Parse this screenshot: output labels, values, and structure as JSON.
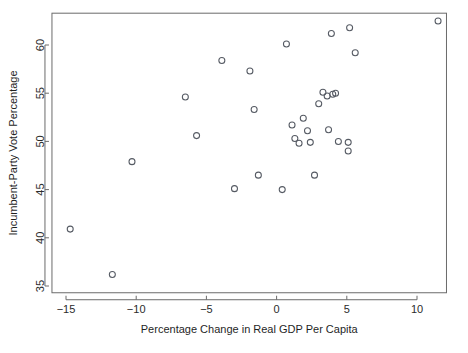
{
  "chart_data": {
    "type": "scatter",
    "title": "",
    "xlabel": "Percentage Change in Real GDP Per Capita",
    "ylabel": "Incumbent-Party Vote Percentage",
    "xlim": [
      -16.0,
      12.1
    ],
    "ylim": [
      34.3,
      63.3
    ],
    "grid": false,
    "legend": null,
    "marker": "open-circle",
    "marker_color": "#555a63",
    "frame_color": "#6b6b6b",
    "xticks": [
      -15,
      -10,
      -5,
      0,
      5,
      10
    ],
    "xtick_labels": [
      "−15",
      "−10",
      "−5",
      "0",
      "5",
      "10"
    ],
    "yticks": [
      35,
      40,
      45,
      50,
      55,
      60
    ],
    "ytick_labels": [
      "35",
      "40",
      "45",
      "50",
      "55",
      "60"
    ],
    "series": [
      {
        "name": "elections",
        "points": [
          {
            "x": -14.7,
            "y": 40.9
          },
          {
            "x": -11.7,
            "y": 36.2
          },
          {
            "x": -10.3,
            "y": 47.9
          },
          {
            "x": -6.5,
            "y": 54.6
          },
          {
            "x": -5.7,
            "y": 50.6
          },
          {
            "x": -3.9,
            "y": 58.4
          },
          {
            "x": -3.0,
            "y": 45.1
          },
          {
            "x": -1.9,
            "y": 57.3
          },
          {
            "x": -1.6,
            "y": 53.3
          },
          {
            "x": -1.3,
            "y": 46.5
          },
          {
            "x": 0.4,
            "y": 45.0
          },
          {
            "x": 0.7,
            "y": 60.1
          },
          {
            "x": 1.1,
            "y": 51.7
          },
          {
            "x": 1.3,
            "y": 50.3
          },
          {
            "x": 1.6,
            "y": 49.8
          },
          {
            "x": 1.9,
            "y": 52.4
          },
          {
            "x": 2.2,
            "y": 51.1
          },
          {
            "x": 2.4,
            "y": 49.9
          },
          {
            "x": 2.7,
            "y": 46.5
          },
          {
            "x": 3.0,
            "y": 53.9
          },
          {
            "x": 3.3,
            "y": 55.1
          },
          {
            "x": 3.6,
            "y": 54.7
          },
          {
            "x": 3.7,
            "y": 51.2
          },
          {
            "x": 3.9,
            "y": 61.2
          },
          {
            "x": 4.0,
            "y": 54.9
          },
          {
            "x": 4.2,
            "y": 55.0
          },
          {
            "x": 4.4,
            "y": 50.0
          },
          {
            "x": 5.1,
            "y": 49.9
          },
          {
            "x": 5.1,
            "y": 49.0
          },
          {
            "x": 5.2,
            "y": 61.8
          },
          {
            "x": 5.6,
            "y": 59.2
          },
          {
            "x": 11.5,
            "y": 62.5
          }
        ]
      }
    ]
  }
}
